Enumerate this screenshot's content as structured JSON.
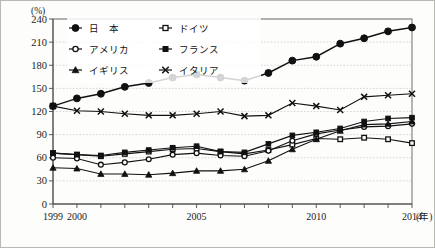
{
  "chart_data": {
    "type": "line",
    "title": "",
    "subtitle": "",
    "xlabel": "(年)",
    "ylabel": "(%)",
    "xlim": [
      1999,
      2014
    ],
    "ylim": [
      0,
      240
    ],
    "ytick_values": [
      0,
      30,
      60,
      90,
      120,
      150,
      180,
      210,
      240
    ],
    "ytick_labels": [
      "0",
      "30",
      "60",
      "90",
      "120",
      "150",
      "180",
      "210",
      "240"
    ],
    "x": [
      1999,
      2000,
      2001,
      2002,
      2003,
      2004,
      2005,
      2006,
      2007,
      2008,
      2009,
      2010,
      2011,
      2012,
      2013,
      2014
    ],
    "xtick_labels": [
      "1999",
      "2000",
      "",
      "",
      "",
      "",
      "2005",
      "",
      "",
      "",
      "",
      "2010",
      "",
      "",
      "",
      "2014"
    ],
    "grid": true,
    "grid_axis": "y",
    "legend_position": "upper-left",
    "series": [
      {
        "name": "日　本",
        "marker": "filled-circle",
        "values": [
          127,
          137,
          143,
          152,
          157,
          164,
          168,
          164,
          160,
          170,
          186,
          191,
          208,
          215,
          224,
          229
        ]
      },
      {
        "name": "ドイツ",
        "marker": "open-square",
        "values": [
          66,
          64,
          62,
          65,
          68,
          71,
          72,
          68,
          65,
          70,
          77,
          85,
          84,
          86,
          84,
          79
        ]
      },
      {
        "name": "アメリカ",
        "marker": "open-circle",
        "values": [
          60,
          59,
          51,
          54,
          58,
          64,
          66,
          63,
          62,
          69,
          82,
          91,
          96,
          100,
          101,
          104
        ]
      },
      {
        "name": "フランス",
        "marker": "filled-square",
        "values": [
          66,
          64,
          63,
          67,
          70,
          73,
          75,
          68,
          67,
          78,
          89,
          93,
          98,
          107,
          111,
          112
        ]
      },
      {
        "name": "イギリス",
        "marker": "filled-triangle",
        "values": [
          47,
          46,
          39,
          39,
          38,
          40,
          43,
          43,
          45,
          56,
          71,
          84,
          95,
          103,
          104,
          107
        ]
      },
      {
        "name": "イタリア",
        "marker": "x-cross",
        "values": [
          127,
          121,
          120,
          117,
          115,
          115,
          117,
          120,
          114,
          115,
          131,
          127,
          122,
          139,
          141,
          143
        ]
      }
    ]
  },
  "axis": {
    "y_unit_label": "(%)",
    "x_unit_label": "(年)"
  },
  "legend": {
    "entries": [
      {
        "label": "日　本",
        "marker": "filled-circle"
      },
      {
        "label": "ドイツ",
        "marker": "open-square"
      },
      {
        "label": "アメリカ",
        "marker": "open-circle"
      },
      {
        "label": "フランス",
        "marker": "filled-square"
      },
      {
        "label": "イギリス",
        "marker": "filled-triangle"
      },
      {
        "label": "イタリア",
        "marker": "x-cross"
      }
    ]
  },
  "colors": {
    "ink": "#111111",
    "grid": "#bbbbbb",
    "frame": "#6f6f6f",
    "background": "#fdfdfb"
  }
}
